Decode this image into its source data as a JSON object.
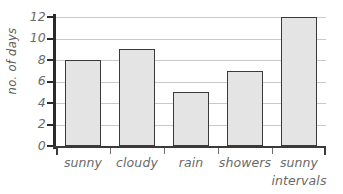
{
  "chart_data": {
    "type": "bar",
    "title": "",
    "xlabel": "",
    "ylabel": "no. of days",
    "categories": [
      "sunny",
      "cloudy",
      "rain",
      "showers",
      "sunny intervals"
    ],
    "category_lines": [
      [
        "sunny"
      ],
      [
        "cloudy"
      ],
      [
        "rain"
      ],
      [
        "showers"
      ],
      [
        "sunny",
        "intervals"
      ]
    ],
    "values": [
      8,
      9,
      5,
      7,
      12
    ],
    "ylim": [
      0,
      12
    ],
    "ytick_labels": [
      "12",
      "10",
      "8",
      "6",
      "4",
      "2",
      "0"
    ],
    "ytick_values": [
      12,
      10,
      8,
      6,
      4,
      2,
      0
    ],
    "grid": "horizontal",
    "legend": "none",
    "colors": {
      "bar_fill": "#e4e4e4",
      "bar_border": "#3a3a3a",
      "gridline": "#c9c9c9",
      "axis": "#2b2b2b",
      "text": "#6a6a6a",
      "background": "#ffffff"
    }
  }
}
